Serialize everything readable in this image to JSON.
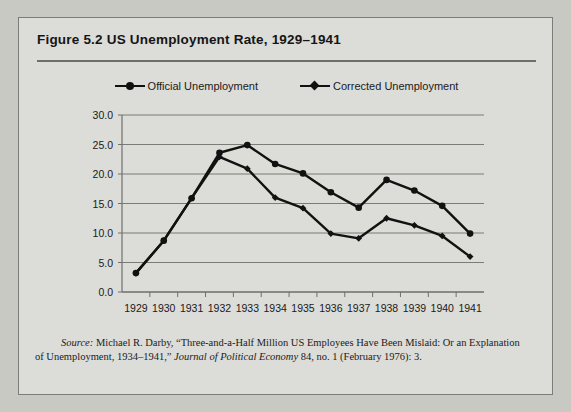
{
  "figure": {
    "title": "Figure 5.2  US Unemployment Rate, 1929–1941"
  },
  "legend": {
    "position": "top-center",
    "items": [
      {
        "label": "Official Unemployment",
        "marker": "circle-marker",
        "color": "#111111"
      },
      {
        "label": "Corrected Unemployment",
        "marker": "diamond-marker",
        "color": "#111111"
      }
    ]
  },
  "source": {
    "label": "Source:",
    "line1": " Michael R. Darby, “Three-and-a-Half Million US Employees Have Been Mislaid: Or an Explanation",
    "line2_pre": "of Unemployment, 1934–1941,” ",
    "journal": "Journal of Political Economy",
    "line2_post": " 84, no. 1 (February 1976): 3."
  },
  "chart_data": {
    "type": "line",
    "title": "US Unemployment Rate, 1929–1941",
    "xlabel": "",
    "ylabel": "",
    "categories": [
      1929,
      1930,
      1931,
      1932,
      1933,
      1934,
      1935,
      1936,
      1937,
      1938,
      1939,
      1940,
      1941
    ],
    "xtick_labels": [
      "1929",
      "1930",
      "1931",
      "1932",
      "1933",
      "1934",
      "1935",
      "1936",
      "1937",
      "1938",
      "1939",
      "1940",
      "1941"
    ],
    "ytick_labels": [
      "0.0",
      "5.0",
      "10.0",
      "15.0",
      "20.0",
      "25.0",
      "30.0"
    ],
    "ytick_values": [
      0.0,
      5.0,
      10.0,
      15.0,
      20.0,
      25.0,
      30.0
    ],
    "ylim": [
      0.0,
      30.0
    ],
    "grid": "horizontal",
    "legend_position": "top-center",
    "series": [
      {
        "name": "Official Unemployment",
        "marker": "circle",
        "color": "#111111",
        "values": [
          3.2,
          8.7,
          15.9,
          23.6,
          24.9,
          21.7,
          20.1,
          16.9,
          14.3,
          19.0,
          17.2,
          14.6,
          9.9
        ]
      },
      {
        "name": "Corrected Unemployment",
        "marker": "diamond",
        "color": "#111111",
        "values": [
          3.2,
          8.7,
          15.9,
          22.9,
          20.9,
          16.0,
          14.2,
          9.9,
          9.1,
          12.5,
          11.3,
          9.5,
          6.0
        ]
      }
    ]
  }
}
